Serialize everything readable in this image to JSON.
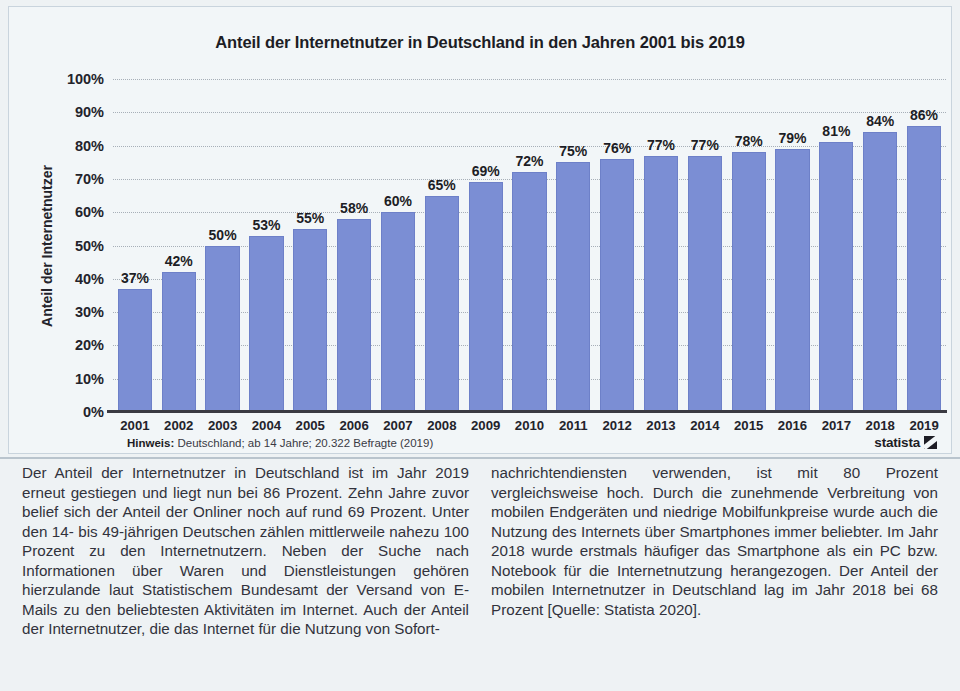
{
  "chart_data": {
    "type": "bar",
    "title": "Anteil der Internetnutzer in Deutschland in den Jahren 2001 bis 2019",
    "xlabel": "",
    "ylabel": "Anteil der Internetnutzer",
    "ylim": [
      0,
      100
    ],
    "grid": true,
    "legend": "none",
    "unit": "%",
    "categories": [
      "2001",
      "2002",
      "2003",
      "2004",
      "2005",
      "2006",
      "2007",
      "2008",
      "2009",
      "2010",
      "2011",
      "2012",
      "2013",
      "2014",
      "2015",
      "2016",
      "2017",
      "2018",
      "2019"
    ],
    "values": [
      37,
      42,
      50,
      53,
      55,
      58,
      60,
      65,
      69,
      72,
      75,
      76,
      77,
      77,
      78,
      79,
      81,
      84,
      86
    ],
    "data_labels": [
      "37%",
      "42%",
      "50%",
      "53%",
      "55%",
      "58%",
      "60%",
      "65%",
      "69%",
      "72%",
      "75%",
      "76%",
      "77%",
      "77%",
      "78%",
      "79%",
      "81%",
      "84%",
      "86%"
    ],
    "ytick_labels": [
      "100%",
      "90%",
      "80%",
      "70%",
      "60%",
      "50%",
      "40%",
      "30%",
      "20%",
      "10%",
      "0%"
    ],
    "ytick_values": [
      100,
      90,
      80,
      70,
      60,
      50,
      40,
      30,
      20,
      10,
      0
    ],
    "bar_color": "#7b8ed4",
    "plot_background": "#f2f6f8"
  },
  "footnote": {
    "prefix": "Hinweis:",
    "text": " Deutschland; ab 14 Jahre; 20.322 Befragte (2019)"
  },
  "brand": {
    "name": "statista"
  },
  "article": {
    "left_column": "Der Anteil der Internetnutzer in Deutschland ist im Jahr 2019 erneut gestiegen und liegt nun bei 86 Prozent. Zehn Jahre zuvor belief sich der Anteil der Onliner noch auf rund 69 Prozent. Unter den 14- bis 49-jährigen Deutschen zählen mittlerweile nahezu 100 Prozent zu den Internetnutzern. Neben der Suche nach Informationen über Waren und Dienstleistungen gehören hierzulande laut Statistischem Bundesamt der Versand von E-Mails zu den beliebtesten Aktivitäten im Internet. Auch der Anteil der Internetnutzer, die das Internet für die Nutzung von Sofort-",
    "right_column": "nachrichtendiensten verwenden, ist mit 80 Prozent vergleichsweise hoch. Durch die zunehmende Verbreitung von mobilen Endgeräten und niedrige Mobilfunkpreise wurde auch die Nutzung des Internets über Smartphones immer beliebter. Im Jahr 2018 wurde erstmals häufiger das Smartphone als ein PC bzw. Notebook für die Internetnutzung herangezogen. Der Anteil der mobilen Internetnutzer in Deutschland lag im Jahr 2018 bei 68 Prozent [Quelle: Statista 2020]."
  }
}
